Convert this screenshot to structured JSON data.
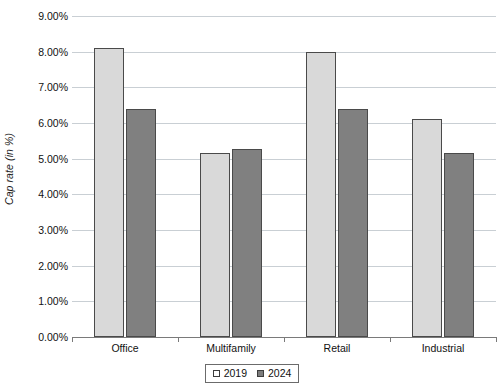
{
  "chart_data": {
    "type": "bar",
    "title": "",
    "xlabel": "",
    "ylabel": "Cap rate (in %)",
    "categories": [
      "Office",
      "Multifamily",
      "Retail",
      "Industrial"
    ],
    "series": [
      {
        "name": "2019",
        "values": [
          8.1,
          5.15,
          8.0,
          6.1
        ],
        "color": "#d9d9d9"
      },
      {
        "name": "2024",
        "values": [
          6.4,
          5.28,
          6.4,
          5.15
        ],
        "color": "#808080"
      }
    ],
    "ylim": [
      0,
      9
    ],
    "ytick_values": [
      0,
      1,
      2,
      3,
      4,
      5,
      6,
      7,
      8,
      9
    ],
    "ytick_labels": [
      "0.00%",
      "1.00%",
      "2.00%",
      "3.00%",
      "4.00%",
      "5.00%",
      "6.00%",
      "7.00%",
      "8.00%",
      "9.00%"
    ],
    "grid": true,
    "legend_position": "bottom-center",
    "legend_entries": [
      "2019",
      "2024"
    ]
  },
  "axis": {
    "y_title": "Cap rate (in %)"
  },
  "legend": {
    "items": [
      {
        "label": "2019"
      },
      {
        "label": "2024"
      }
    ]
  }
}
